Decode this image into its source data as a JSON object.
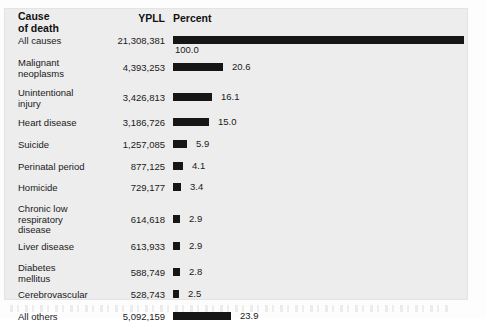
{
  "figure": {
    "headers": {
      "cause_line1": "Cause",
      "cause_line2": "of death",
      "ypll": "YPLL",
      "percent": "Percent"
    }
  },
  "chart_data": {
    "type": "bar",
    "title": "",
    "xlabel": "Percent",
    "ylabel": "Cause of death",
    "orientation": "horizontal",
    "grid": false,
    "legend": null,
    "xlim": [
      0,
      100
    ],
    "bar_color": "#161616",
    "columns": [
      "Cause of death",
      "YPLL",
      "Percent"
    ],
    "categories": [
      "All causes",
      "Malignant neoplasms",
      "Unintentional injury",
      "Heart disease",
      "Suicide",
      "Perinatal period",
      "Homicide",
      "Chronic low respiratory disease",
      "Liver disease",
      "Diabetes mellitus",
      "Cerebrovascular",
      "All others"
    ],
    "ypll": [
      "21,308,381",
      "4,393,253",
      "3,426,813",
      "3,186,726",
      "1,257,085",
      "877,125",
      "729,177",
      "614,618",
      "613,933",
      "588,749",
      "528,743",
      "5,092,159"
    ],
    "values": [
      100.0,
      20.6,
      16.1,
      15.0,
      5.9,
      4.1,
      3.4,
      2.9,
      2.9,
      2.8,
      2.5,
      23.9
    ],
    "value_labels": [
      "100.0",
      "20.6",
      "16.1",
      "15.0",
      "5.9",
      "4.1",
      "3.4",
      "2.9",
      "2.9",
      "2.8",
      "2.5",
      "23.9"
    ]
  },
  "rows": [
    {
      "label": "All causes",
      "label2": "",
      "ypll": "21,308,381",
      "pct": "100.0",
      "barw": 291,
      "full": true,
      "h": 22
    },
    {
      "label": "Malignant",
      "label2": "neoplasms",
      "ypll": "4,393,253",
      "pct": "20.6",
      "barw": 50,
      "full": false,
      "h": 30
    },
    {
      "label": "Unintentional",
      "label2": "injury",
      "ypll": "3,426,813",
      "pct": "16.1",
      "barw": 39,
      "full": false,
      "h": 30
    },
    {
      "label": "Heart disease",
      "label2": "",
      "ypll": "3,186,726",
      "pct": "15.0",
      "barw": 36,
      "full": false,
      "h": 22
    },
    {
      "label": "Suicide",
      "label2": "",
      "ypll": "1,257,085",
      "pct": "5.9",
      "barw": 14,
      "full": false,
      "h": 22
    },
    {
      "label": "Perinatal period",
      "label2": "",
      "ypll": "877,125",
      "pct": "4.1",
      "barw": 10,
      "full": false,
      "h": 21
    },
    {
      "label": "Homicide",
      "label2": "",
      "ypll": "729,177",
      "pct": "3.4",
      "barw": 8,
      "full": false,
      "h": 21
    },
    {
      "label": "Chronic low",
      "label2": "respiratory",
      "label3": "disease",
      "ypll": "614,618",
      "pct": "2.9",
      "barw": 7,
      "full": false,
      "h": 38
    },
    {
      "label": "Liver disease",
      "label2": "",
      "ypll": "613,933",
      "pct": "2.9",
      "barw": 7,
      "full": false,
      "h": 21
    },
    {
      "label": "Diabetes",
      "label2": "mellitus",
      "ypll": "588,749",
      "pct": "2.8",
      "barw": 7,
      "full": false,
      "h": 27
    },
    {
      "label": "Cerebrovascular",
      "label2": "",
      "ypll": "528,743",
      "pct": "2.5",
      "barw": 6,
      "full": false,
      "h": 22
    },
    {
      "label": "All others",
      "label2": "",
      "ypll": "5,092,159",
      "pct": "23.9",
      "barw": 58,
      "full": false,
      "h": 22
    }
  ]
}
